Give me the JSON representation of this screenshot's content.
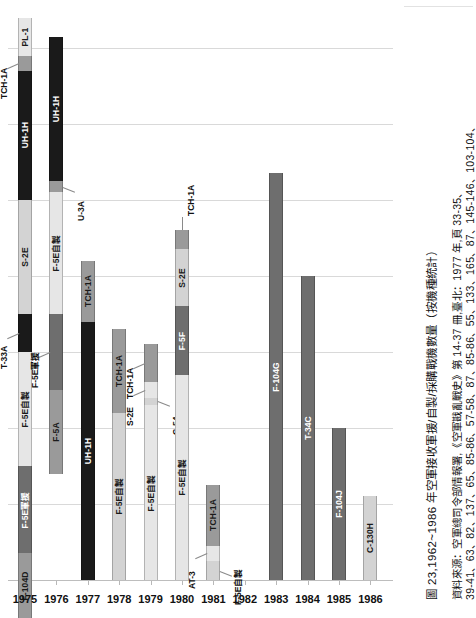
{
  "figure": {
    "caption": "圖 23,1962~1986 年空軍接收軍援/自製/採購戰機數量（按機種統計）",
    "source_line1": "資料來源：空軍總司令部情報署,《空軍戡亂戰史》第 14-37 冊,臺北：1977 年,頁 33-35、",
    "source_line2": "39-41、63、82、137、65、85-86、57-58、87、85-86、55、133、165、87、145-146、103-104、"
  },
  "colors": {
    "black": "#1a1a1a",
    "dark_gray": "#6e6e6e",
    "mid_gray": "#9a9a9a",
    "light_gray": "#d3d3d3",
    "very_light_gray": "#e6e6e6",
    "grid": "#d9d9d9",
    "axis": "#bdbdbd"
  },
  "chart_data": {
    "type": "bar",
    "title": "圖 23,1962~1986 年空軍接收軍援/自製/採購戰機數量（按機種統計）",
    "xlabel": "",
    "ylabel": "",
    "grid": true,
    "legend": "none",
    "orientation": "vertical",
    "stacked": true,
    "ylim": [
      0,
      150
    ],
    "gridline_values": [
      140,
      120,
      100,
      80,
      60,
      40,
      20
    ],
    "categories": [
      "1975",
      "1976",
      "1977",
      "1978",
      "1979",
      "1980",
      "1981",
      "1982",
      "1983",
      "1984",
      "1985",
      "1986"
    ],
    "totals": [
      148,
      143,
      84,
      66,
      62,
      92,
      25,
      0,
      107,
      80,
      40,
      22
    ],
    "series": [
      {
        "year": "1975",
        "total": 148,
        "segments": [
          {
            "label": "PL-1",
            "value": 10,
            "shade": "very_light_gray",
            "label_pos": "inside"
          },
          {
            "label": "TCH-1A",
            "value": 4,
            "shade": "mid_gray",
            "label_pos": "leader-left"
          },
          {
            "label": "UH-1H",
            "value": 34,
            "shade": "black",
            "label_pos": "inside"
          },
          {
            "label": "S-2E",
            "value": 30,
            "shade": "light_gray",
            "label_pos": "inside"
          },
          {
            "label": "T-33A",
            "value": 10,
            "shade": "black",
            "label_pos": "leader-left"
          },
          {
            "label": "F-5E自製",
            "value": 30,
            "shade": "very_light_gray",
            "label_pos": "inside"
          },
          {
            "label": "F-5E軍援",
            "value": 23,
            "shade": "dark_gray",
            "label_pos": "inside"
          },
          {
            "label": "F-104D",
            "value": 17,
            "shade": "mid_gray",
            "label_pos": "inside"
          }
        ]
      },
      {
        "year": "1976",
        "total": 143,
        "segments": [
          {
            "label": "UH-1H",
            "value": 38,
            "shade": "black",
            "label_pos": "inside"
          },
          {
            "label": "U-3A",
            "value": 3,
            "shade": "mid_gray",
            "label_pos": "leader-right"
          },
          {
            "label": "F-5E自製",
            "value": 32,
            "shade": "very_light_gray",
            "label_pos": "inside"
          },
          {
            "label": "F-5E軍援",
            "value": 20,
            "shade": "dark_gray",
            "label_pos": "leader-left"
          },
          {
            "label": "F-5A",
            "value": 22,
            "shade": "mid_gray",
            "label_pos": "inside"
          }
        ]
      },
      {
        "year": "1977",
        "total": 84,
        "segments": [
          {
            "label": "TCH-1A",
            "value": 16,
            "shade": "mid_gray",
            "label_pos": "inside"
          },
          {
            "label": "UH-1H",
            "value": 68,
            "shade": "black",
            "label_pos": "inside"
          }
        ]
      },
      {
        "year": "1978",
        "total": 66,
        "segments": [
          {
            "label": "TCH-1A",
            "value": 22,
            "shade": "mid_gray",
            "label_pos": "inside"
          },
          {
            "label": "F-5E自製",
            "value": 44,
            "shade": "light_gray",
            "label_pos": "inside"
          }
        ]
      },
      {
        "year": "1979",
        "total": 62,
        "segments": [
          {
            "label": "TCH-1A",
            "value": 10,
            "shade": "mid_gray",
            "label_pos": "leader-left"
          },
          {
            "label": "S-2E",
            "value": 4,
            "shade": "very_light_gray",
            "label_pos": "inside"
          },
          {
            "label": "C-54",
            "value": 2,
            "shade": "light_gray",
            "label_pos": "leader-right"
          },
          {
            "label": "F-5E自製",
            "value": 46,
            "shade": "very_light_gray",
            "label_pos": "inside"
          }
        ]
      },
      {
        "year": "1980",
        "total": 92,
        "segments": [
          {
            "label": "TCH-1A",
            "value": 5,
            "shade": "mid_gray",
            "label_pos": "leader-up"
          },
          {
            "label": "S-2E",
            "value": 15,
            "shade": "light_gray",
            "label_pos": "inside"
          },
          {
            "label": "F-5F",
            "value": 18,
            "shade": "dark_gray",
            "label_pos": "inside"
          },
          {
            "label": "F-5E自製",
            "value": 54,
            "shade": "very_light_gray",
            "label_pos": "inside"
          }
        ]
      },
      {
        "year": "1981",
        "total": 25,
        "segments": [
          {
            "label": "TCH-1A",
            "value": 16,
            "shade": "mid_gray",
            "label_pos": "inside"
          },
          {
            "label": "AT-3",
            "value": 4,
            "shade": "very_light_gray",
            "label_pos": "leader-left"
          },
          {
            "label": "F-5E自製",
            "value": 5,
            "shade": "light_gray",
            "label_pos": "leader-right"
          }
        ]
      },
      {
        "year": "1982",
        "total": 0,
        "segments": []
      },
      {
        "year": "1983",
        "total": 107,
        "segments": [
          {
            "label": "F-104G",
            "value": 107,
            "shade": "dark_gray",
            "label_pos": "inside"
          }
        ]
      },
      {
        "year": "1984",
        "total": 80,
        "segments": [
          {
            "label": "T-34C",
            "value": 80,
            "shade": "dark_gray",
            "label_pos": "inside"
          }
        ]
      },
      {
        "year": "1985",
        "total": 40,
        "segments": [
          {
            "label": "F-104J",
            "value": 40,
            "shade": "dark_gray",
            "label_pos": "inside"
          }
        ]
      },
      {
        "year": "1986",
        "total": 22,
        "segments": [
          {
            "label": "C-130H",
            "value": 22,
            "shade": "light_gray",
            "label_pos": "inside"
          }
        ]
      }
    ]
  }
}
